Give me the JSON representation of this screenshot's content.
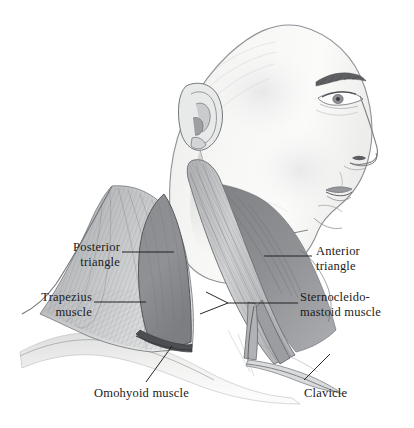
{
  "figure": {
    "style": "graphite pencil anatomical illustration",
    "background_color": "#ffffff",
    "ink_color": "#1b1b1b"
  },
  "labels": [
    {
      "id": "posterior-triangle",
      "text": "Posterior\ntriangle",
      "align": "right",
      "x": 22,
      "y": 240,
      "width": 98
    },
    {
      "id": "trapezius-muscle",
      "text": "Trapezius\nmuscle",
      "align": "right",
      "x": 6,
      "y": 290,
      "width": 86
    },
    {
      "id": "omohyoid-muscle",
      "text": "Omohyoid muscle",
      "align": "left",
      "x": 94,
      "y": 386,
      "width": 120
    },
    {
      "id": "anterior-triangle",
      "text": "Anterior\ntriangle",
      "align": "left",
      "x": 316,
      "y": 244,
      "width": 80
    },
    {
      "id": "sternocleidomastoid-muscle",
      "text": "Sternocleido-\nmastoid muscle",
      "align": "left",
      "x": 300,
      "y": 290,
      "width": 110
    },
    {
      "id": "clavicle",
      "text": "Clavicle",
      "align": "left",
      "x": 304,
      "y": 386,
      "width": 60
    }
  ],
  "anatomy": {
    "regions": [
      {
        "name": "posterior-triangle",
        "shading": "mid-gray",
        "hex": "#8d8f93"
      },
      {
        "name": "anterior-triangle",
        "shading": "mid-gray",
        "hex": "#8a8c90"
      },
      {
        "name": "trapezius-muscle",
        "shading": "striated light gray",
        "hex": "#b9bbbd"
      },
      {
        "name": "sternocleidomastoid-muscle",
        "shading": "striated light gray",
        "hex": "#c2c4c6"
      },
      {
        "name": "omohyoid-muscle",
        "shading": "thin dark band",
        "hex": "#4a4c50"
      },
      {
        "name": "clavicle",
        "shading": "pale ridge",
        "hex": "#d8d9da"
      },
      {
        "name": "face",
        "shading": "soft white with graphite shading",
        "hex": "#f2f2f1"
      }
    ]
  }
}
